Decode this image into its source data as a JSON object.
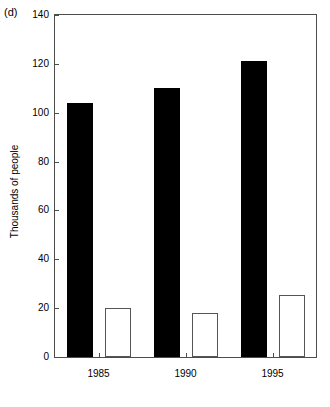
{
  "panel": {
    "label": "(d)"
  },
  "chart_data": {
    "type": "bar",
    "title": "",
    "subtitle": "",
    "xlabel": "",
    "ylabel": "Thousands of people",
    "categories": [
      "1985",
      "1990",
      "1995"
    ],
    "ylim": [
      0,
      140
    ],
    "yticks": [
      0,
      20,
      40,
      60,
      80,
      100,
      120,
      140
    ],
    "ytick_labels": [
      "0",
      "20",
      "40",
      "60",
      "80",
      "100",
      "120",
      "140"
    ],
    "grid": false,
    "legend": null,
    "legend_position": "none",
    "series": [
      {
        "name": "filled",
        "fill": "#000000",
        "values": [
          104,
          110,
          121
        ]
      },
      {
        "name": "hollow",
        "fill": "#ffffff",
        "values": [
          20,
          18,
          25.5
        ]
      }
    ]
  },
  "colors": {
    "filled_bar": "#000000",
    "hollow_bar": "#ffffff",
    "axis": "#4d4d4d",
    "background": "#ffffff"
  }
}
